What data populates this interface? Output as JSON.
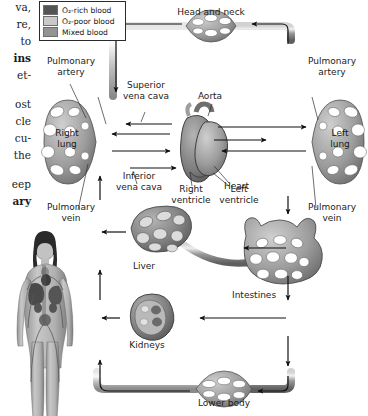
{
  "figure": {
    "type": "anatomical-flow-diagram"
  },
  "legend": {
    "items": [
      {
        "label": "O₂-rich blood",
        "color": "#545454",
        "name": "o2-rich"
      },
      {
        "label": "O₂-poor blood",
        "color": "#c9c9c9",
        "name": "o2-poor"
      },
      {
        "label": "Mixed blood",
        "color": "#939393",
        "name": "mixed"
      }
    ]
  },
  "margin_text": {
    "fragments": [
      {
        "text": "va,",
        "bold": false,
        "top": 2
      },
      {
        "text": "re,",
        "bold": false,
        "top": 19
      },
      {
        "text": "to",
        "bold": false,
        "top": 36
      },
      {
        "text": "ins",
        "bold": true,
        "top": 53
      },
      {
        "text": "et-",
        "bold": false,
        "top": 70
      },
      {
        "text": "ost",
        "bold": false,
        "top": 99
      },
      {
        "text": "cle",
        "bold": false,
        "top": 116
      },
      {
        "text": "cu-",
        "bold": false,
        "top": 133
      },
      {
        "text": "the",
        "bold": false,
        "top": 150
      },
      {
        "text": "eep",
        "bold": false,
        "top": 179
      },
      {
        "text": "ary",
        "bold": true,
        "top": 196
      }
    ]
  },
  "labels": {
    "head_and_neck": "Head and neck",
    "pulmonary_artery_l": "Pulmonary\nartery",
    "pulmonary_artery_r": "Pulmonary\nartery",
    "superior_vena_cava": "Superior\nvena cava",
    "aorta": "Aorta",
    "right_lung": "Right\nlung",
    "left_lung": "Left\nlung",
    "inferior_vena_cava": "Inferior\nvena cava",
    "heart": "Heart",
    "right_ventricle": "Right\nventricle",
    "left_ventricle": "Left\nventricle",
    "pulmonary_vein_l": "Pulmonary\nvein",
    "pulmonary_vein_r": "Pulmonary\nvein",
    "liver": "Liver",
    "intestines": "Intestines",
    "kidneys": "Kidneys",
    "lower_body": "Lower body"
  },
  "colors": {
    "vessel_dark": "#5e5e5e",
    "vessel_mid": "#8f8f8f",
    "vessel_light": "#c4c4c4",
    "organ_fill": "#9a9a9a",
    "organ_dark": "#6b6b6b",
    "outline": "#3a3a3a",
    "arrow": "#111111",
    "text": "#1b1b1b",
    "background": "#ffffff"
  },
  "figure_human": {
    "name": "human-body-anatomy-illustration",
    "description": "Female anatomical figure showing circulatory system"
  },
  "flow": {
    "arrow_count": 18,
    "direction_note": "clockwise systemic loop with pulmonary side loops"
  }
}
